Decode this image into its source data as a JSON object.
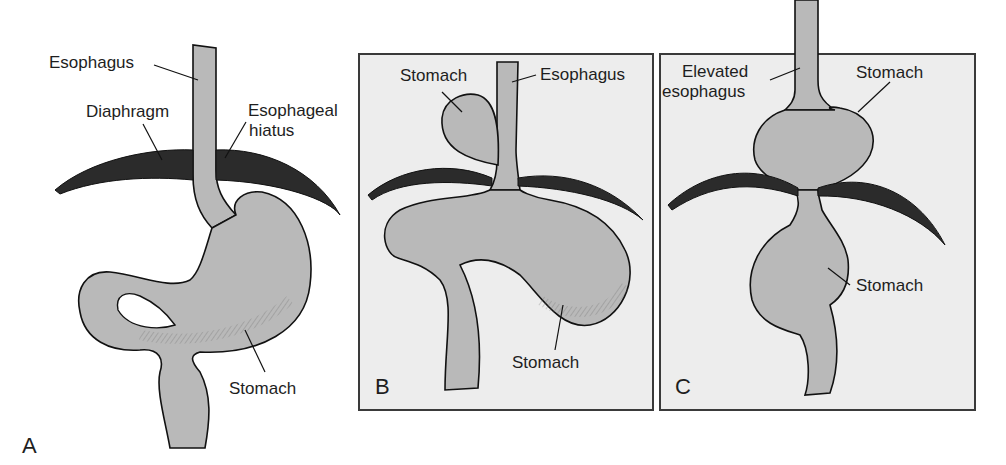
{
  "figure": {
    "panels": [
      {
        "id": "A",
        "letter": "A",
        "description": "Normal anatomy",
        "labels": {
          "esophagus": "Esophagus",
          "diaphragm": "Diaphragm",
          "hiatus_line1": "Esophageal",
          "hiatus_line2": "hiatus",
          "stomach": "Stomach"
        }
      },
      {
        "id": "B",
        "letter": "B",
        "description": "Paraesophageal (rolling) hiatal hernia",
        "labels": {
          "stomach_upper": "Stomach",
          "esophagus": "Esophagus",
          "stomach_lower": "Stomach"
        }
      },
      {
        "id": "C",
        "letter": "C",
        "description": "Sliding hiatal hernia",
        "labels": {
          "elevated_line1": "Elevated",
          "elevated_line2": "esophagus",
          "stomach_upper": "Stomach",
          "stomach_lower": "Stomach"
        }
      }
    ],
    "colors": {
      "organ_fill": "#b9b9b9",
      "diaphragm_fill": "#2b2b2b",
      "outline": "#111111",
      "panel_bg": "#ededed",
      "panel_border": "#3a3a3a",
      "text": "#1e1e1e"
    }
  }
}
